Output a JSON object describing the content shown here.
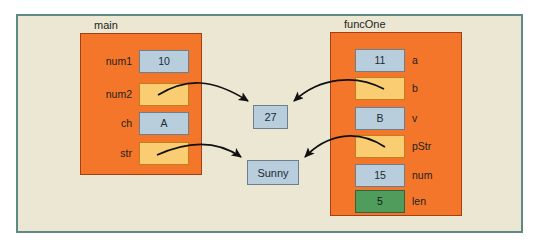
{
  "diagram": {
    "title_main": "main",
    "title_funcone": "funcOne",
    "colors": {
      "frame_border": "#5f8985",
      "frame_background": "#ece7d2",
      "block_fill": "#f4762a",
      "block_border": "#a33f13",
      "box_blue": "#b8cedd",
      "box_yellow": "#fbcd72",
      "box_green": "#4f9c5c",
      "arrow": "#111111"
    }
  },
  "main_frame": {
    "label": "main",
    "variables": [
      {
        "name": "num1",
        "value": "10",
        "style": "blue"
      },
      {
        "name": "num2",
        "value": "",
        "style": "yellow"
      },
      {
        "name": "ch",
        "value": "A",
        "style": "blue"
      },
      {
        "name": "str",
        "value": "",
        "style": "yellow"
      }
    ]
  },
  "funcone_frame": {
    "label": "funcOne",
    "variables": [
      {
        "name": "a",
        "value": "11",
        "style": "blue"
      },
      {
        "name": "b",
        "value": "",
        "style": "yellow"
      },
      {
        "name": "v",
        "value": "B",
        "style": "blue"
      },
      {
        "name": "pStr",
        "value": "",
        "style": "yellow"
      },
      {
        "name": "num",
        "value": "15",
        "style": "blue"
      },
      {
        "name": "len",
        "value": "5",
        "style": "green"
      }
    ]
  },
  "heap_values": [
    {
      "id": "int-value",
      "value": "27"
    },
    {
      "id": "string-value",
      "value": "Sunny"
    }
  ],
  "pointers": [
    {
      "from": "num2",
      "to": "27"
    },
    {
      "from": "b",
      "to": "27"
    },
    {
      "from": "str",
      "to": "Sunny"
    },
    {
      "from": "pStr",
      "to": "Sunny"
    }
  ]
}
